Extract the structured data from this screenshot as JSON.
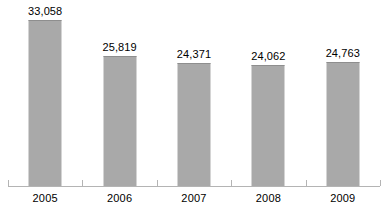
{
  "chart_data": {
    "type": "bar",
    "title": "",
    "subtitle": "",
    "xlabel": "",
    "ylabel": "",
    "categories": [
      "2005",
      "2006",
      "2007",
      "2008",
      "2009"
    ],
    "values": [
      33058,
      25819,
      24371,
      24062,
      24763
    ],
    "value_labels": [
      "33,058",
      "25,819",
      "24,371",
      "24,062",
      "24,763"
    ],
    "series": [
      {
        "name": "",
        "values": [
          33058,
          25819,
          24371,
          24062,
          24763
        ]
      }
    ],
    "ylim": [
      0,
      37000
    ],
    "grid": false,
    "legend": false,
    "legend_position": "none",
    "annotations": [],
    "colors": {
      "bar_fill": "#a9a9a9",
      "bar_top_edge": "#8e8e8e",
      "axis_line": "#b4b4b4",
      "label_text": "#000000",
      "background": "#ffffff"
    }
  },
  "axis": {
    "tick_count": 6,
    "baseline_visible": true
  }
}
